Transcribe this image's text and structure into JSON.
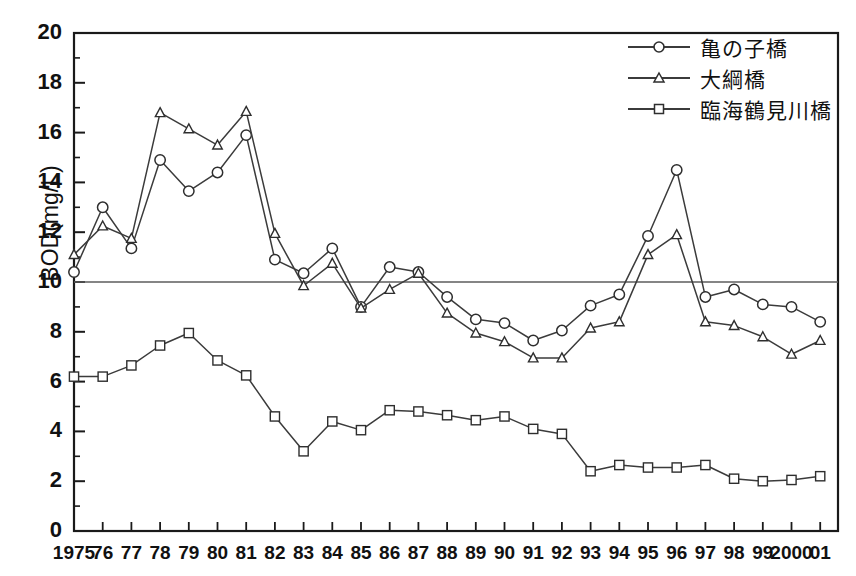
{
  "chart_data": {
    "type": "line",
    "title": "",
    "xlabel": "",
    "ylabel": "BOD(mg/L)",
    "ylim": [
      0,
      20
    ],
    "ytick_values": [
      0,
      2,
      4,
      6,
      8,
      10,
      12,
      14,
      16,
      18,
      20
    ],
    "ytick_labels": [
      "0",
      "2",
      "4",
      "6",
      "8",
      "10",
      "12",
      "14",
      "16",
      "18",
      "20"
    ],
    "yminor_step": 1,
    "grid": false,
    "legend_position": "top-right",
    "reference_line": {
      "value": 10,
      "label": ""
    },
    "x": [
      1975,
      1976,
      1977,
      1978,
      1979,
      1980,
      1981,
      1982,
      1983,
      1984,
      1985,
      1986,
      1987,
      1988,
      1989,
      1990,
      1991,
      1992,
      1993,
      1994,
      1995,
      1996,
      1997,
      1998,
      1999,
      2000,
      2001
    ],
    "categories": [
      "1975",
      "76",
      "77",
      "78",
      "79",
      "80",
      "81",
      "82",
      "83",
      "84",
      "85",
      "86",
      "87",
      "88",
      "89",
      "90",
      "91",
      "92",
      "93",
      "94",
      "95",
      "96",
      "97",
      "98",
      "99",
      "2000",
      "01"
    ],
    "series": [
      {
        "name": "亀の子橋",
        "marker": "circle",
        "values": [
          10.4,
          13.0,
          11.35,
          14.9,
          13.65,
          14.4,
          15.9,
          10.9,
          10.35,
          11.35,
          9.0,
          10.6,
          10.4,
          9.4,
          8.5,
          8.35,
          7.65,
          8.05,
          9.05,
          9.5,
          11.85,
          14.5,
          9.4,
          9.7,
          9.1,
          9.0,
          8.4
        ]
      },
      {
        "name": "大綱橋",
        "marker": "triangle",
        "values": [
          11.1,
          12.25,
          11.75,
          16.8,
          16.15,
          15.5,
          16.85,
          11.95,
          9.85,
          10.75,
          8.95,
          9.7,
          10.35,
          8.75,
          7.95,
          7.6,
          6.95,
          6.95,
          8.15,
          8.4,
          11.1,
          11.9,
          8.4,
          8.25,
          7.8,
          7.1,
          7.65
        ]
      },
      {
        "name": "臨海鶴見川橋",
        "marker": "square",
        "values": [
          6.2,
          6.2,
          6.65,
          7.45,
          7.95,
          6.85,
          6.25,
          4.6,
          3.2,
          4.4,
          4.05,
          4.85,
          4.8,
          4.65,
          4.45,
          4.6,
          4.1,
          3.9,
          2.4,
          2.65,
          2.55,
          2.55,
          2.65,
          2.1,
          2.0,
          2.05,
          2.2
        ]
      }
    ]
  },
  "legend": {
    "items": [
      {
        "label": "亀の子橋",
        "marker": "circle"
      },
      {
        "label": "大綱橋",
        "marker": "triangle"
      },
      {
        "label": "臨海鶴見川橋",
        "marker": "square"
      }
    ]
  },
  "colors": {
    "line": "#3b3b3b",
    "axis": "#1a1a1a",
    "reference_line": "#5c5c5c",
    "marker_fill": "#ffffff",
    "background": "#ffffff"
  }
}
